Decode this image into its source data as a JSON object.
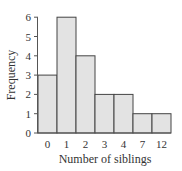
{
  "chart_data": {
    "type": "bar",
    "title": "",
    "xlabel": "Number of siblings",
    "ylabel": "Frequency",
    "categories": [
      "0",
      "1",
      "2",
      "3",
      "4",
      "7",
      "12"
    ],
    "values": [
      3,
      6,
      4,
      2,
      2,
      1,
      1
    ],
    "ylim": [
      0,
      6
    ],
    "yticks": [
      0,
      1,
      2,
      3,
      4,
      5,
      6
    ],
    "grid": false,
    "legend": null,
    "bar_fill": "#e3e3e3",
    "bar_stroke": "#444444",
    "axis_color": "#555555"
  }
}
